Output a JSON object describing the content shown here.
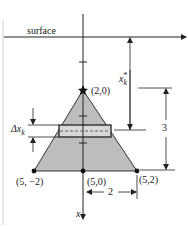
{
  "diagram": {
    "surface_label": "surface",
    "apex_label": "(2,0)",
    "base_left_label": "(5, −2)",
    "base_center_label": "(5,0)",
    "base_right_label": "(5,2)",
    "depth_label_main": "x",
    "depth_label_sub": "k",
    "depth_label_sup": "*",
    "strip_width_label_main": "Δx",
    "strip_width_label_sub": "k",
    "height_dimension_label": "3",
    "half_base_dimension_label": "2",
    "axis_label": "x",
    "colors": {
      "triangle_fill": "#bdbdbd",
      "strip_fill": "#d8d8d8",
      "line": "#222222"
    }
  }
}
